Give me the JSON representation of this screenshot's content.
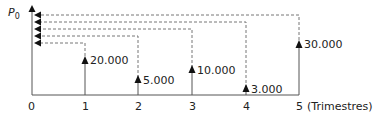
{
  "diagram": {
    "y_label": "P",
    "y_label_sub": "0",
    "x_unit": "(Trimestres)",
    "ticks": [
      "0",
      "1",
      "2",
      "3",
      "4",
      "5"
    ],
    "flows": [
      {
        "period": 1,
        "label": "20.000"
      },
      {
        "period": 2,
        "label": "5.000"
      },
      {
        "period": 3,
        "label": "10.000"
      },
      {
        "period": 4,
        "label": "3.000"
      },
      {
        "period": 5,
        "label": "30.000"
      }
    ],
    "colors": {
      "line": "#555555",
      "dash": "#777777",
      "text": "#222222"
    }
  }
}
